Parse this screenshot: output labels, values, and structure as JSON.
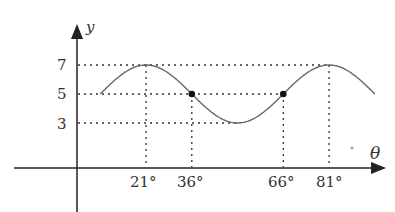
{
  "chart_data": {
    "type": "line",
    "title": "",
    "xlabel": "θ",
    "ylabel": "y",
    "function": "y = 5 + 2cos(6(θ − 21°))",
    "x_ticks": [
      "21°",
      "36°",
      "66°",
      "81°"
    ],
    "y_ticks": [
      "3",
      "5",
      "7"
    ],
    "x": [
      6,
      21,
      36,
      51,
      66,
      81,
      96
    ],
    "values": [
      5,
      7,
      5,
      3,
      5,
      7,
      5
    ],
    "marked_points": [
      {
        "x": 36,
        "y": 5
      },
      {
        "x": 66,
        "y": 5
      }
    ],
    "grid": "dotted guide lines at y=3,5,7 and θ=21,36,66,81",
    "legend": null
  },
  "labels": {
    "y_axis": "y",
    "x_axis": "θ",
    "y7": "7",
    "y5": "5",
    "y3": "3",
    "x21": "21°",
    "x36": "36°",
    "x66": "66°",
    "x81": "81°"
  }
}
